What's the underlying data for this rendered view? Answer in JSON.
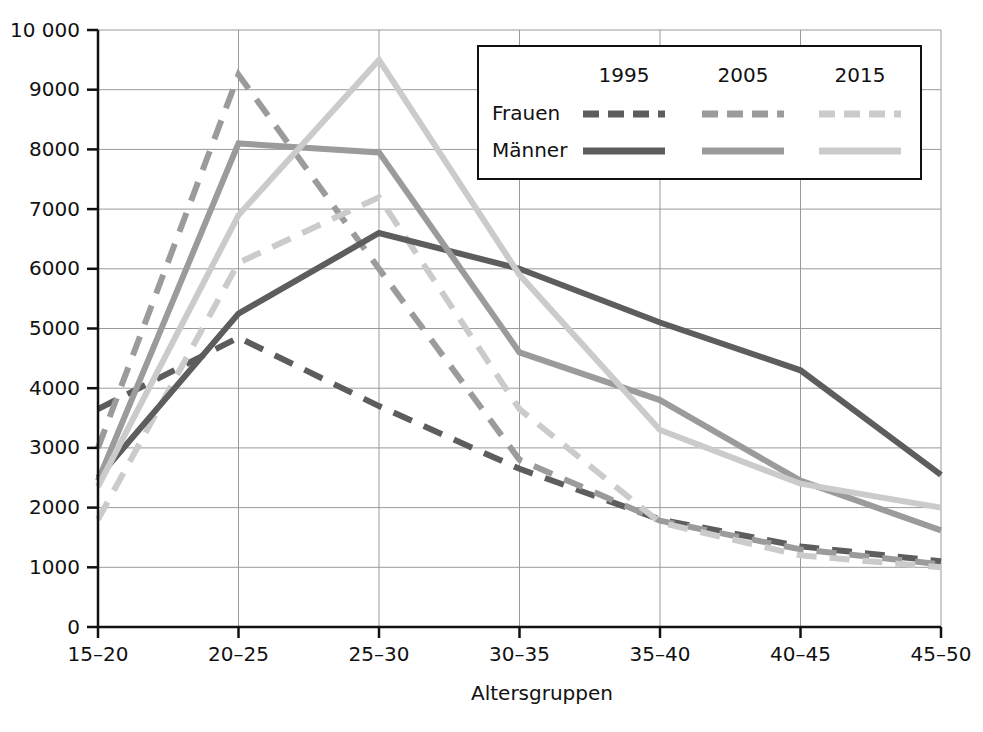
{
  "chart_data": {
    "type": "line",
    "title": "",
    "xlabel": "Altersgruppen",
    "ylabel": "",
    "categories": [
      "15–20",
      "20–25",
      "25–30",
      "30–35",
      "35–40",
      "40–45",
      "45–50"
    ],
    "ylim": [
      0,
      10000
    ],
    "ytick_step": 1000,
    "yticks": [
      "0",
      "1000",
      "2000",
      "3000",
      "4000",
      "5000",
      "6000",
      "7000",
      "8000",
      "9000",
      "10 000"
    ],
    "ytick_values": [
      0,
      1000,
      2000,
      3000,
      4000,
      5000,
      6000,
      7000,
      8000,
      9000,
      10000
    ],
    "grid": true,
    "legend_position": "top-right",
    "legend": {
      "columns": [
        "1995",
        "2005",
        "2015"
      ],
      "rows": [
        "Frauen",
        "Männer"
      ],
      "row_styles": [
        "dashed",
        "solid"
      ]
    },
    "series": [
      {
        "name": "Frauen 1995",
        "sex": "Frauen",
        "year": "1995",
        "style": "dashed",
        "color": "#5d5d5d",
        "values": [
          3650,
          4850,
          3700,
          2650,
          1800,
          1350,
          1100
        ]
      },
      {
        "name": "Frauen 2005",
        "sex": "Frauen",
        "year": "2005",
        "style": "dashed",
        "color": "#9b9b9b",
        "values": [
          3000,
          9250,
          6000,
          2800,
          1780,
          1300,
          1050
        ]
      },
      {
        "name": "Frauen 2015",
        "sex": "Frauen",
        "year": "2015",
        "style": "dashed",
        "color": "#cbcbcb",
        "values": [
          1800,
          6100,
          7200,
          3650,
          1750,
          1200,
          1000
        ]
      },
      {
        "name": "Männer 1995",
        "sex": "Männer",
        "year": "1995",
        "style": "solid",
        "color": "#5d5d5d",
        "values": [
          2500,
          5250,
          6600,
          6000,
          5100,
          4300,
          2550
        ]
      },
      {
        "name": "Männer 2005",
        "sex": "Männer",
        "year": "2005",
        "style": "solid",
        "color": "#9b9b9b",
        "values": [
          2450,
          8100,
          7950,
          4600,
          3800,
          2450,
          1620
        ]
      },
      {
        "name": "Männer 2015",
        "sex": "Männer",
        "year": "2015",
        "style": "solid",
        "color": "#cbcbcb",
        "values": [
          2350,
          6900,
          9500,
          5900,
          3300,
          2400,
          2000
        ]
      }
    ]
  },
  "colors": {
    "y1995": "#5d5d5d",
    "y2005": "#9b9b9b",
    "y2015": "#cbcbcb",
    "axis": "#111111",
    "grid": "#9a9a9a",
    "background": "#ffffff"
  }
}
